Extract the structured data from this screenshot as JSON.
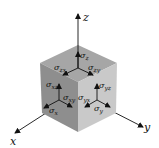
{
  "diagram": {
    "axes": {
      "x": "x",
      "y": "y",
      "z": "z"
    },
    "faces": {
      "top": {
        "normal": {
          "symbol": "σ",
          "sub": "z"
        },
        "shear_1": {
          "symbol": "σ",
          "sub": "zx"
        },
        "shear_2": {
          "symbol": "σ",
          "sub": "zy"
        }
      },
      "left": {
        "normal": {
          "symbol": "σ",
          "sub": "x"
        },
        "shear_1": {
          "symbol": "σ",
          "sub": "xz"
        },
        "shear_2": {
          "symbol": "σ",
          "sub": "xy"
        }
      },
      "right": {
        "normal": {
          "symbol": "σ",
          "sub": "y"
        },
        "shear_1": {
          "symbol": "σ",
          "sub": "yz"
        },
        "shear_2": {
          "symbol": "σ",
          "sub": "yx"
        }
      }
    },
    "colors": {
      "top_face": "#a6a6a6",
      "left_face": "#8e8e8e",
      "right_face": "#c9c9c9",
      "line": "#111111"
    }
  }
}
